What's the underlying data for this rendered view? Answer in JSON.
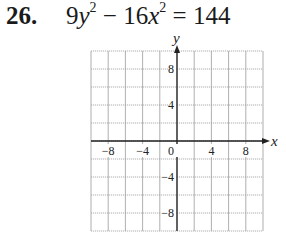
{
  "problem": {
    "number": "26.",
    "equation": {
      "term1_coef": "9",
      "term1_var": "y",
      "term1_exp": "2",
      "operator": "−",
      "term2_coef": "16",
      "term2_var": "x",
      "term2_exp": "2",
      "equals": "= 144"
    }
  },
  "chart_data": {
    "type": "scatter",
    "xlabel": "x",
    "ylabel": "y",
    "xlim": [
      -10,
      10
    ],
    "ylim": [
      -10,
      10
    ],
    "grid": true,
    "grid_step": 2,
    "x_ticks": [
      -8,
      -4,
      0,
      4,
      8
    ],
    "y_ticks": [
      8,
      4,
      -4,
      -8
    ],
    "x_tick_labels": [
      "−8",
      "−4",
      "0",
      "4",
      "8"
    ],
    "y_tick_labels": [
      "8",
      "4",
      "−4",
      "−8"
    ],
    "series": []
  }
}
